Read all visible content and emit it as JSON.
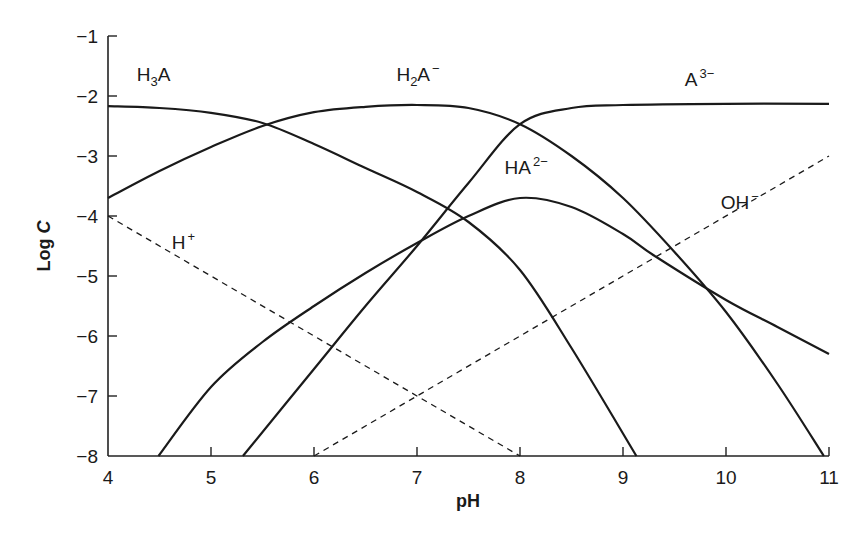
{
  "chart_data": {
    "type": "line",
    "title": "",
    "xlabel": "pH",
    "ylabel": "Log C",
    "xlim": [
      4,
      11
    ],
    "ylim": [
      -8,
      -1
    ],
    "grid": false,
    "legend": "inline labels",
    "x_ticks": [
      "4",
      "5",
      "6",
      "7",
      "8",
      "9",
      "10",
      "11"
    ],
    "y_ticks": [
      "−1",
      "−2",
      "−3",
      "−4",
      "−5",
      "−6",
      "−7",
      "−8"
    ],
    "series": [
      {
        "name": "H3A",
        "label_main": "H",
        "label_sub": "3",
        "label_tail": "A",
        "label_sup": "",
        "style": "solid",
        "points": [
          [
            4,
            -2.17
          ],
          [
            4.5,
            -2.2
          ],
          [
            5,
            -2.28
          ],
          [
            5.5,
            -2.45
          ],
          [
            6,
            -2.8
          ],
          [
            6.5,
            -3.2
          ],
          [
            7,
            -3.6
          ],
          [
            7.5,
            -4.1
          ],
          [
            8,
            -4.9
          ],
          [
            8.5,
            -6.2
          ],
          [
            9.13,
            -8
          ]
        ],
        "label_pos": [
          4.28,
          -1.75
        ]
      },
      {
        "name": "H2A−",
        "label_main": "H",
        "label_sub": "2",
        "label_tail": "A",
        "label_sup": "−",
        "style": "solid",
        "points": [
          [
            4,
            -3.7
          ],
          [
            4.5,
            -3.25
          ],
          [
            5,
            -2.85
          ],
          [
            5.5,
            -2.5
          ],
          [
            6,
            -2.27
          ],
          [
            6.5,
            -2.18
          ],
          [
            7,
            -2.15
          ],
          [
            7.5,
            -2.2
          ],
          [
            8,
            -2.47
          ],
          [
            8.5,
            -3.0
          ],
          [
            9,
            -3.7
          ],
          [
            9.5,
            -4.6
          ],
          [
            10,
            -5.6
          ],
          [
            10.5,
            -6.8
          ],
          [
            10.95,
            -8
          ]
        ],
        "label_pos": [
          6.8,
          -1.75
        ]
      },
      {
        "name": "HA2−",
        "label_main": "HA",
        "label_sub": "",
        "label_tail": "",
        "label_sup": "2−",
        "style": "solid",
        "points": [
          [
            4.49,
            -8
          ],
          [
            5,
            -6.85
          ],
          [
            5.5,
            -6.1
          ],
          [
            6,
            -5.5
          ],
          [
            6.5,
            -4.95
          ],
          [
            7,
            -4.45
          ],
          [
            7.5,
            -4.0
          ],
          [
            8,
            -3.7
          ],
          [
            8.5,
            -3.85
          ],
          [
            9,
            -4.3
          ],
          [
            9.32,
            -4.68
          ],
          [
            10,
            -5.4
          ],
          [
            10.5,
            -5.85
          ],
          [
            11,
            -6.3
          ]
        ],
        "label_pos": [
          7.85,
          -3.3
        ]
      },
      {
        "name": "A3−",
        "label_main": "A",
        "label_sub": "",
        "label_tail": "",
        "label_sup": "3−",
        "style": "solid",
        "points": [
          [
            5.31,
            -8
          ],
          [
            6,
            -6.55
          ],
          [
            6.5,
            -5.5
          ],
          [
            7,
            -4.5
          ],
          [
            7.5,
            -3.45
          ],
          [
            8,
            -2.47
          ],
          [
            8.5,
            -2.2
          ],
          [
            9,
            -2.15
          ],
          [
            10,
            -2.13
          ],
          [
            11,
            -2.13
          ]
        ],
        "label_pos": [
          9.6,
          -1.83
        ]
      },
      {
        "name": "H+",
        "label_main": "H",
        "label_sub": "",
        "label_tail": "",
        "label_sup": "+",
        "style": "dashed",
        "points": [
          [
            4,
            -4
          ],
          [
            8,
            -8
          ]
        ],
        "label_pos": [
          4.62,
          -4.55
        ]
      },
      {
        "name": "OH−",
        "label_main": "OH",
        "label_sub": "",
        "label_tail": "",
        "label_sup": "−",
        "style": "dashed",
        "points": [
          [
            6,
            -8
          ],
          [
            11,
            -3
          ]
        ],
        "label_pos": [
          9.95,
          -3.88
        ]
      }
    ]
  }
}
